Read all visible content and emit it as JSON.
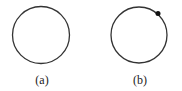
{
  "figures": [
    {
      "label": "(a)",
      "circle": {
        "cx": 41,
        "cy": 35,
        "r": 28.5
      },
      "dot": null
    },
    {
      "label": "(b)",
      "circle": {
        "cx": 139,
        "cy": 35,
        "r": 28
      },
      "dot": {
        "cx": 158,
        "cy": 13.5,
        "r": 2.5
      }
    }
  ],
  "colors": {
    "stroke": "#333333",
    "dot": "#111111"
  }
}
